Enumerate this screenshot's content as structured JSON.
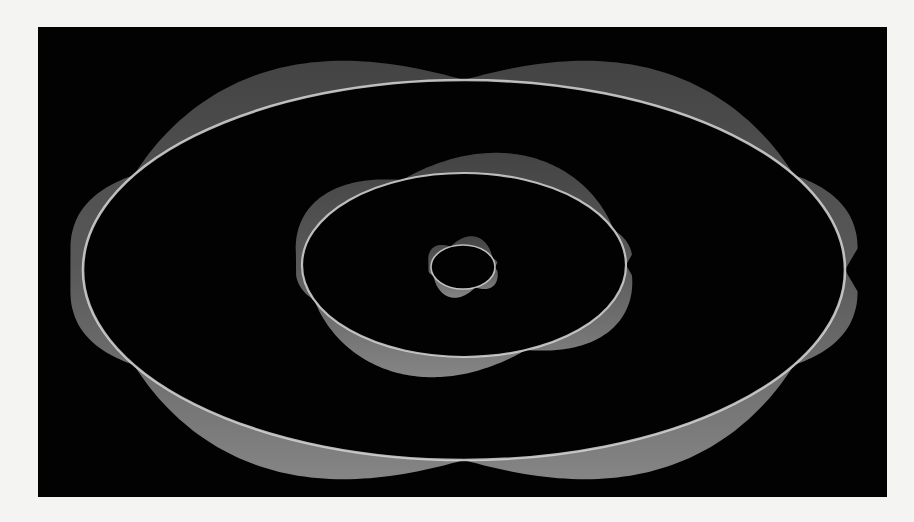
{
  "figure": {
    "background": "#020202",
    "page_background": "#f4f4f2",
    "frame": {
      "left": 38,
      "top": 27,
      "width": 849,
      "height": 470
    }
  },
  "rings": [
    {
      "name": "outer-ring",
      "cx": 426,
      "cy": 243,
      "rx": 381,
      "ry": 190,
      "nodes": 6,
      "amplitude": 36,
      "phase_deg": 90,
      "band_color_top": "#4a4a4a",
      "band_color_bottom": "#8a8a8a",
      "line_color": "#d8d8d8",
      "line_width": 2.6
    },
    {
      "name": "middle-ring",
      "cx": 426,
      "cy": 238,
      "rx": 162,
      "ry": 92,
      "nodes": 4,
      "amplitude": 24,
      "phase_deg": 45,
      "band_color_top": "#4a4a4a",
      "band_color_bottom": "#8a8a8a",
      "line_color": "#d8d8d8",
      "line_width": 2.2
    },
    {
      "name": "inner-ring",
      "cx": 425,
      "cy": 240,
      "rx": 32,
      "ry": 22,
      "nodes": 4,
      "amplitude": 10,
      "phase_deg": 45,
      "band_color_top": "#555555",
      "band_color_bottom": "#909090",
      "line_color": "#d8d8d8",
      "line_width": 1.6
    }
  ]
}
